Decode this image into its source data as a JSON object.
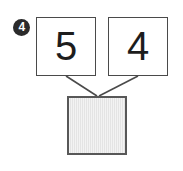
{
  "problem": {
    "marker_label": "4",
    "marker_icon": "filled-circle-number-icon",
    "type": "number-bond",
    "addends": [
      {
        "name": "first-addend",
        "value": "5"
      },
      {
        "name": "second-addend",
        "value": "4"
      }
    ],
    "sum": {
      "name": "sum-answer",
      "value": "",
      "filled": false
    },
    "connectors": [
      {
        "name": "connector-left",
        "from": "first-addend",
        "to": "sum-answer"
      },
      {
        "name": "connector-right",
        "from": "second-addend",
        "to": "sum-answer"
      }
    ]
  },
  "colors": {
    "page_background": "#ffffff",
    "box_border": "#4a4a4a",
    "sum_box_fill": "#e4e4e4",
    "sum_box_border": "#585858",
    "marker_fill": "#2b2b2b",
    "marker_text": "#ffffff",
    "digit_color": "#1d1d1d",
    "connector_line": "#4a4a4a"
  }
}
